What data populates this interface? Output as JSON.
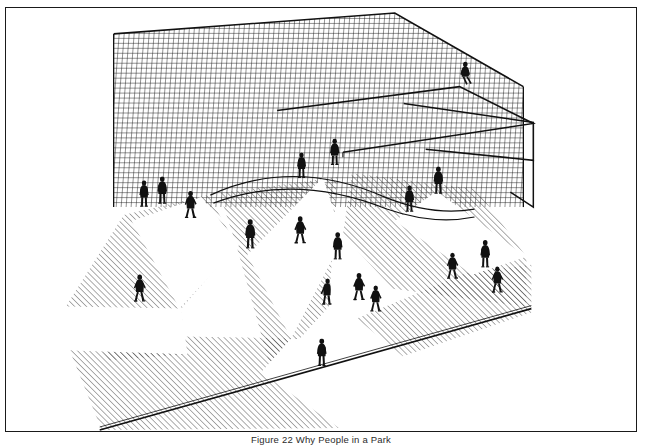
{
  "document": {
    "kind": "figure-plate",
    "background_color": "#ffffff",
    "frame": {
      "border_color": "#1a1a1a",
      "border_width_px": 1.6,
      "x": 5,
      "y": 7,
      "width": 632,
      "height": 425
    }
  },
  "caption": {
    "text": "Figure 22 Why People in a Park",
    "align": "center",
    "color": "#2b2b2b",
    "clipped_at_bottom_edge": true
  },
  "illustration": {
    "title": "Plaza with lattice screen wall, sunlight wedges and pedestrians",
    "style": "black and white line drawing, perspective view",
    "ink_color": "#111111",
    "hatch_color": "#3a3a3a",
    "paper_color": "#ffffff",
    "elements": [
      "lattice-screen-wall",
      "upper-ledge-rails",
      "curved-ramp-rail",
      "ground-plane",
      "hatched-shadow-areas",
      "white-sunlight-wedges",
      "pedestrian-figures",
      "seated-figure-on-rail"
    ],
    "wall": {
      "name": "lattice-screen-wall",
      "cell_size_px": 5,
      "line_width_px": 0.9,
      "outline_points": "113,33 395,12 524,86 524,204 113,204",
      "top_edge_front": "113,33 395,12",
      "top_edge_back": "395,12 524,86"
    },
    "rails": [
      {
        "name": "upper-rail-long",
        "points": "280,100 460,78 534,120 340,143"
      },
      {
        "name": "upper-rail-short",
        "points": "404,95 534,118 534,154 420,140"
      },
      {
        "name": "curved-ramp-rail",
        "points": "205,186 330,165 395,185 430,200 460,205"
      }
    ],
    "ground": {
      "name": "ground-plane",
      "front_edge": "99,424 527,308",
      "edge_line_width_px": 1.6
    },
    "hatching": {
      "angle_deg": 45,
      "direction": "lower-left to upper-right",
      "spacing_px": 4.2,
      "stroke_width_px": 0.85,
      "stroke_color": "#3b3b3b"
    },
    "shadow_regions": [
      {
        "name": "shadow-left-lobe",
        "points": "66,302 120,214 200,192 228,236 174,300 178,348 110,352"
      },
      {
        "name": "shadow-center-wedge",
        "points": "228,236 212,186 330,172 320,300 268,362"
      },
      {
        "name": "shadow-right-wedge",
        "points": "345,168 470,184 520,252 520,300 386,282 336,228"
      },
      {
        "name": "shadow-bottom-left",
        "points": "70,342 176,330 290,332 330,420 100,424"
      },
      {
        "name": "shadow-bottom-right",
        "points": "352,310 460,268 527,260 527,308 400,348"
      }
    ],
    "light_wedges": [
      {
        "name": "light-wedge-left",
        "points": "200,192 232,236 176,300 130,214"
      },
      {
        "name": "light-wedge-center",
        "points": "320,172 336,230 286,330 246,246"
      },
      {
        "name": "light-wedge-right",
        "points": "430,186 520,250 470,268 392,214"
      }
    ],
    "figures": [
      {
        "name": "figure-1",
        "x": 139,
        "y": 186,
        "h": 26,
        "pose": "standing",
        "facing": "left"
      },
      {
        "name": "figure-2",
        "x": 157,
        "y": 182,
        "h": 27,
        "pose": "standing",
        "facing": "front"
      },
      {
        "name": "figure-3",
        "x": 186,
        "y": 196,
        "h": 29,
        "pose": "walking",
        "facing": "right"
      },
      {
        "name": "figure-4",
        "x": 245,
        "y": 226,
        "h": 30,
        "pose": "standing",
        "facing": "front"
      },
      {
        "name": "figure-5",
        "x": 135,
        "y": 280,
        "h": 28,
        "pose": "walking",
        "facing": "left"
      },
      {
        "name": "figure-6",
        "x": 296,
        "y": 222,
        "h": 30,
        "pose": "walking",
        "facing": "right"
      },
      {
        "name": "figure-7",
        "x": 297,
        "y": 157,
        "h": 26,
        "pose": "standing",
        "facing": "front"
      },
      {
        "name": "figure-8",
        "x": 330,
        "y": 144,
        "h": 27,
        "pose": "standing",
        "facing": "front"
      },
      {
        "name": "figure-9",
        "x": 333,
        "y": 238,
        "h": 27,
        "pose": "standing",
        "facing": "front"
      },
      {
        "name": "figure-10",
        "x": 355,
        "y": 279,
        "h": 30,
        "pose": "walking",
        "facing": "left"
      },
      {
        "name": "figure-11",
        "x": 322,
        "y": 283,
        "h": 29,
        "pose": "bending",
        "facing": "right"
      },
      {
        "name": "figure-12",
        "x": 372,
        "y": 291,
        "h": 28,
        "pose": "walking",
        "facing": "right"
      },
      {
        "name": "figure-13",
        "x": 317,
        "y": 345,
        "h": 28,
        "pose": "standing",
        "facing": "front"
      },
      {
        "name": "figure-14",
        "x": 434,
        "y": 172,
        "h": 28,
        "pose": "standing",
        "facing": "front"
      },
      {
        "name": "figure-15",
        "x": 449,
        "y": 258,
        "h": 28,
        "pose": "walking",
        "facing": "left"
      },
      {
        "name": "figure-16",
        "x": 481,
        "y": 246,
        "h": 28,
        "pose": "standing",
        "facing": "front"
      },
      {
        "name": "figure-17",
        "x": 494,
        "y": 272,
        "h": 28,
        "pose": "walking",
        "facing": "right"
      },
      {
        "name": "figure-18",
        "x": 405,
        "y": 191,
        "h": 27,
        "pose": "standing",
        "facing": "front"
      },
      {
        "name": "figure-19",
        "x": 467,
        "y": 72,
        "h": 26,
        "pose": "seated-on-rail",
        "facing": "front"
      }
    ]
  }
}
